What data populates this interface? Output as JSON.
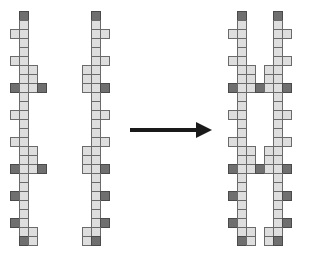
{
  "diagram": {
    "colors": {
      "light_cell": "#dedede",
      "dark_cell": "#6f6f6f",
      "arrow": "#1a1a1a"
    },
    "grid": {
      "origin_y": 11,
      "cell_size": 9,
      "rows": 26
    },
    "strands": [
      {
        "name": "left-strand-a",
        "main_x": 19,
        "cells": [
          [
            0,
            0,
            "dark"
          ],
          [
            1,
            0,
            "light"
          ],
          [
            2,
            -1,
            "light"
          ],
          [
            2,
            0,
            "light"
          ],
          [
            3,
            0,
            "light"
          ],
          [
            4,
            0,
            "light"
          ],
          [
            5,
            -1,
            "light"
          ],
          [
            5,
            0,
            "light"
          ],
          [
            6,
            0,
            "light"
          ],
          [
            6,
            1,
            "light"
          ],
          [
            7,
            0,
            "light"
          ],
          [
            7,
            1,
            "light"
          ],
          [
            8,
            -1,
            "dark"
          ],
          [
            8,
            0,
            "light"
          ],
          [
            8,
            1,
            "light"
          ],
          [
            8,
            2,
            "dark"
          ],
          [
            9,
            0,
            "light"
          ],
          [
            10,
            0,
            "light"
          ],
          [
            11,
            -1,
            "light"
          ],
          [
            11,
            0,
            "light"
          ],
          [
            12,
            0,
            "light"
          ],
          [
            13,
            0,
            "light"
          ],
          [
            14,
            -1,
            "light"
          ],
          [
            14,
            0,
            "light"
          ],
          [
            15,
            0,
            "light"
          ],
          [
            15,
            1,
            "light"
          ],
          [
            16,
            0,
            "light"
          ],
          [
            16,
            1,
            "light"
          ],
          [
            17,
            -1,
            "dark"
          ],
          [
            17,
            0,
            "light"
          ],
          [
            17,
            1,
            "light"
          ],
          [
            17,
            2,
            "dark"
          ],
          [
            18,
            0,
            "light"
          ],
          [
            19,
            0,
            "light"
          ],
          [
            20,
            -1,
            "dark"
          ],
          [
            20,
            0,
            "light"
          ],
          [
            21,
            0,
            "light"
          ],
          [
            22,
            0,
            "light"
          ],
          [
            23,
            -1,
            "dark"
          ],
          [
            23,
            0,
            "light"
          ],
          [
            24,
            0,
            "light"
          ],
          [
            24,
            1,
            "light"
          ],
          [
            25,
            0,
            "dark"
          ],
          [
            25,
            1,
            "light"
          ]
        ]
      },
      {
        "name": "left-strand-b",
        "main_x": 91,
        "cells": [
          [
            0,
            0,
            "dark"
          ],
          [
            1,
            0,
            "light"
          ],
          [
            2,
            0,
            "light"
          ],
          [
            2,
            1,
            "light"
          ],
          [
            3,
            0,
            "light"
          ],
          [
            4,
            0,
            "light"
          ],
          [
            5,
            0,
            "light"
          ],
          [
            5,
            1,
            "light"
          ],
          [
            6,
            -1,
            "light"
          ],
          [
            6,
            0,
            "light"
          ],
          [
            7,
            -1,
            "light"
          ],
          [
            7,
            0,
            "light"
          ],
          [
            8,
            -1,
            "light"
          ],
          [
            8,
            0,
            "light"
          ],
          [
            8,
            1,
            "dark"
          ],
          [
            9,
            0,
            "light"
          ],
          [
            10,
            0,
            "light"
          ],
          [
            11,
            0,
            "light"
          ],
          [
            11,
            1,
            "light"
          ],
          [
            12,
            0,
            "light"
          ],
          [
            13,
            0,
            "light"
          ],
          [
            14,
            0,
            "light"
          ],
          [
            14,
            1,
            "light"
          ],
          [
            15,
            -1,
            "light"
          ],
          [
            15,
            0,
            "light"
          ],
          [
            16,
            -1,
            "light"
          ],
          [
            16,
            0,
            "light"
          ],
          [
            17,
            -1,
            "light"
          ],
          [
            17,
            0,
            "light"
          ],
          [
            17,
            1,
            "dark"
          ],
          [
            18,
            0,
            "light"
          ],
          [
            19,
            0,
            "light"
          ],
          [
            20,
            0,
            "light"
          ],
          [
            20,
            1,
            "dark"
          ],
          [
            21,
            0,
            "light"
          ],
          [
            22,
            0,
            "light"
          ],
          [
            23,
            0,
            "light"
          ],
          [
            23,
            1,
            "dark"
          ],
          [
            24,
            -1,
            "light"
          ],
          [
            24,
            0,
            "light"
          ],
          [
            25,
            -1,
            "light"
          ],
          [
            25,
            0,
            "dark"
          ]
        ]
      },
      {
        "name": "right-strand-a",
        "main_x": 237,
        "cells": [
          [
            0,
            0,
            "dark"
          ],
          [
            1,
            0,
            "light"
          ],
          [
            2,
            -1,
            "light"
          ],
          [
            2,
            0,
            "light"
          ],
          [
            3,
            0,
            "light"
          ],
          [
            4,
            0,
            "light"
          ],
          [
            5,
            -1,
            "light"
          ],
          [
            5,
            0,
            "light"
          ],
          [
            6,
            0,
            "light"
          ],
          [
            6,
            1,
            "light"
          ],
          [
            7,
            0,
            "light"
          ],
          [
            7,
            1,
            "light"
          ],
          [
            8,
            -1,
            "dark"
          ],
          [
            8,
            0,
            "light"
          ],
          [
            8,
            1,
            "light"
          ],
          [
            8,
            2,
            "dark"
          ],
          [
            9,
            0,
            "light"
          ],
          [
            10,
            0,
            "light"
          ],
          [
            11,
            -1,
            "light"
          ],
          [
            11,
            0,
            "light"
          ],
          [
            12,
            0,
            "light"
          ],
          [
            13,
            0,
            "light"
          ],
          [
            14,
            -1,
            "light"
          ],
          [
            14,
            0,
            "light"
          ],
          [
            15,
            0,
            "light"
          ],
          [
            15,
            1,
            "light"
          ],
          [
            16,
            0,
            "light"
          ],
          [
            16,
            1,
            "light"
          ],
          [
            17,
            -1,
            "dark"
          ],
          [
            17,
            0,
            "light"
          ],
          [
            17,
            1,
            "light"
          ],
          [
            17,
            2,
            "dark"
          ],
          [
            18,
            0,
            "light"
          ],
          [
            19,
            0,
            "light"
          ],
          [
            20,
            -1,
            "dark"
          ],
          [
            20,
            0,
            "light"
          ],
          [
            21,
            0,
            "light"
          ],
          [
            22,
            0,
            "light"
          ],
          [
            23,
            -1,
            "dark"
          ],
          [
            23,
            0,
            "light"
          ],
          [
            24,
            0,
            "light"
          ],
          [
            24,
            1,
            "light"
          ],
          [
            25,
            0,
            "dark"
          ],
          [
            25,
            1,
            "light"
          ]
        ]
      },
      {
        "name": "right-strand-b",
        "main_x": 273,
        "cells": [
          [
            0,
            0,
            "dark"
          ],
          [
            1,
            0,
            "light"
          ],
          [
            2,
            0,
            "light"
          ],
          [
            2,
            1,
            "light"
          ],
          [
            3,
            0,
            "light"
          ],
          [
            4,
            0,
            "light"
          ],
          [
            5,
            0,
            "light"
          ],
          [
            5,
            1,
            "light"
          ],
          [
            6,
            -1,
            "light"
          ],
          [
            6,
            0,
            "light"
          ],
          [
            7,
            -1,
            "light"
          ],
          [
            7,
            0,
            "light"
          ],
          [
            8,
            -1,
            "light"
          ],
          [
            8,
            0,
            "light"
          ],
          [
            8,
            1,
            "dark"
          ],
          [
            9,
            0,
            "light"
          ],
          [
            10,
            0,
            "light"
          ],
          [
            11,
            0,
            "light"
          ],
          [
            11,
            1,
            "light"
          ],
          [
            12,
            0,
            "light"
          ],
          [
            13,
            0,
            "light"
          ],
          [
            14,
            0,
            "light"
          ],
          [
            14,
            1,
            "light"
          ],
          [
            15,
            -1,
            "light"
          ],
          [
            15,
            0,
            "light"
          ],
          [
            16,
            -1,
            "light"
          ],
          [
            16,
            0,
            "light"
          ],
          [
            17,
            -1,
            "light"
          ],
          [
            17,
            0,
            "light"
          ],
          [
            17,
            1,
            "dark"
          ],
          [
            18,
            0,
            "light"
          ],
          [
            19,
            0,
            "light"
          ],
          [
            20,
            0,
            "light"
          ],
          [
            20,
            1,
            "dark"
          ],
          [
            21,
            0,
            "light"
          ],
          [
            22,
            0,
            "light"
          ],
          [
            23,
            0,
            "light"
          ],
          [
            23,
            1,
            "dark"
          ],
          [
            24,
            -1,
            "light"
          ],
          [
            24,
            0,
            "light"
          ],
          [
            25,
            -1,
            "light"
          ],
          [
            25,
            0,
            "dark"
          ]
        ]
      }
    ],
    "arrow": {
      "direction": "right",
      "from_x": 130,
      "to_x": 212,
      "y": 130
    }
  }
}
